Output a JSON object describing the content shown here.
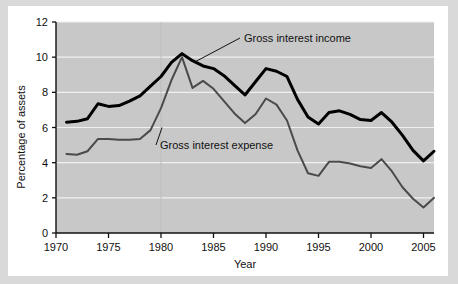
{
  "figure": {
    "background_color": "#ffffff",
    "border_color": "#d9d9d9",
    "plot_background_color": "#c8c8c8",
    "gridline_color": "#f0f0f0"
  },
  "chart_data": {
    "type": "line",
    "title": "",
    "xlabel": "Year",
    "ylabel": "Percentage of assets",
    "xlim": [
      1970,
      2006
    ],
    "ylim": [
      0,
      12
    ],
    "xticks": [
      1970,
      1975,
      1980,
      1985,
      1990,
      1995,
      2000,
      2005
    ],
    "xtick_labels": [
      "1970",
      "1975",
      "1980",
      "1985",
      "1990",
      "1995",
      "2000",
      "2005"
    ],
    "yticks": [
      0,
      2,
      4,
      6,
      8,
      10,
      12
    ],
    "ytick_labels": [
      "0",
      "2",
      "4",
      "6",
      "8",
      "10",
      "12"
    ],
    "grid": "horizontal",
    "legend_position": "inline-annotations",
    "x": [
      1971,
      1972,
      1973,
      1974,
      1975,
      1976,
      1977,
      1978,
      1979,
      1980,
      1981,
      1982,
      1983,
      1984,
      1985,
      1986,
      1987,
      1988,
      1989,
      1990,
      1991,
      1992,
      1993,
      1994,
      1995,
      1996,
      1997,
      1998,
      1999,
      2000,
      2001,
      2002,
      2003,
      2004,
      2005,
      2006
    ],
    "series": [
      {
        "name": "Gross interest income",
        "color": "#000000",
        "line_width": 3,
        "values": [
          6.3,
          6.35,
          6.5,
          7.35,
          7.2,
          7.25,
          7.5,
          7.8,
          8.35,
          8.9,
          9.7,
          10.2,
          9.8,
          9.5,
          9.35,
          8.95,
          8.4,
          7.85,
          8.6,
          9.35,
          9.2,
          8.9,
          7.6,
          6.6,
          6.2,
          6.85,
          6.95,
          6.75,
          6.45,
          6.4,
          6.85,
          6.3,
          5.55,
          4.7,
          4.1,
          4.65
        ]
      },
      {
        "name": "Gross interest expense",
        "color": "#4a4a4a",
        "line_width": 2,
        "values": [
          4.5,
          4.45,
          4.65,
          5.35,
          5.35,
          5.3,
          5.3,
          5.35,
          5.85,
          7.1,
          8.7,
          10.0,
          8.25,
          8.65,
          8.2,
          7.5,
          6.8,
          6.25,
          6.75,
          7.65,
          7.3,
          6.4,
          4.7,
          3.4,
          3.25,
          4.05,
          4.05,
          3.95,
          3.8,
          3.7,
          4.2,
          3.5,
          2.6,
          1.95,
          1.45,
          2.0
        ]
      }
    ],
    "annotations": [
      {
        "text": "Gross interest income",
        "anchor_year": 1983.2,
        "anchor_value": 9.72,
        "label_x": 244,
        "label_y": 42
      },
      {
        "text": "Gross interest expense",
        "anchor_year": 1980.1,
        "anchor_value": 6.0,
        "label_x": 160,
        "label_y": 149
      }
    ]
  }
}
